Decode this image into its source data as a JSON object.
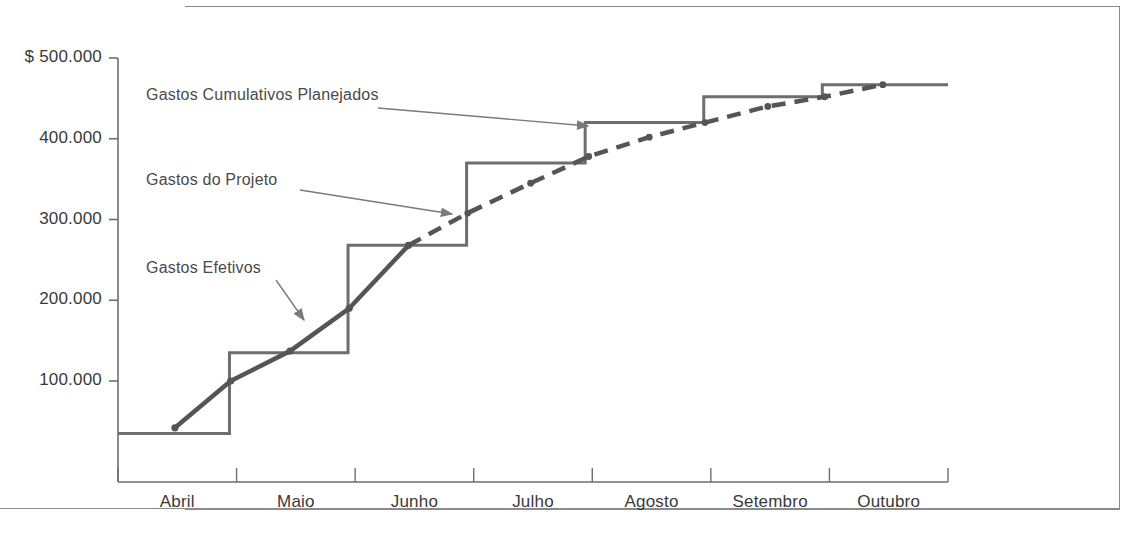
{
  "chart_data": {
    "type": "line",
    "title": "",
    "xlabel": "",
    "ylabel": "",
    "currency_prefix": "$",
    "x_categories": [
      "Abril",
      "Maio",
      "Junho",
      "Julho",
      "Agosto",
      "Setembro",
      "Outubro"
    ],
    "y_ticks": [
      {
        "value": 500000,
        "label": "$ 500.000"
      },
      {
        "value": 400000,
        "label": "400.000"
      },
      {
        "value": 300000,
        "label": "300.000"
      },
      {
        "value": 200000,
        "label": "200.000"
      },
      {
        "value": 100000,
        "label": "100.000"
      }
    ],
    "ylim": [
      0,
      515000
    ],
    "grid": false,
    "legend_position": "inline-annotations",
    "series": [
      {
        "name": "Gastos Cumulativos Planejados",
        "style": "step",
        "color": "#6e6e6e",
        "steps": [
          {
            "x_start": 0.0,
            "x_end": 0.94,
            "value": 35000
          },
          {
            "x_start": 0.94,
            "x_end": 1.94,
            "value": 135000
          },
          {
            "x_start": 1.94,
            "x_end": 2.94,
            "value": 268000
          },
          {
            "x_start": 2.94,
            "x_end": 3.94,
            "value": 370000
          },
          {
            "x_start": 3.94,
            "x_end": 4.94,
            "value": 420000
          },
          {
            "x_start": 4.94,
            "x_end": 5.94,
            "value": 452000
          },
          {
            "x_start": 5.94,
            "x_end": 7.0,
            "value": 467000
          }
        ]
      },
      {
        "name": "Gastos Efetivos",
        "style": "solid-curve",
        "color": "#555555",
        "points": [
          {
            "x": 0.48,
            "y": 42000
          },
          {
            "x": 0.95,
            "y": 100000
          },
          {
            "x": 1.45,
            "y": 137000
          },
          {
            "x": 1.95,
            "y": 190000
          },
          {
            "x": 2.45,
            "y": 268000
          }
        ]
      },
      {
        "name": "Gastos do Projeto",
        "style": "dashed",
        "color": "#555555",
        "points": [
          {
            "x": 2.45,
            "y": 268000
          },
          {
            "x": 2.95,
            "y": 308000
          },
          {
            "x": 3.48,
            "y": 345000
          },
          {
            "x": 3.97,
            "y": 378000
          },
          {
            "x": 4.48,
            "y": 402000
          },
          {
            "x": 4.95,
            "y": 420000
          },
          {
            "x": 5.48,
            "y": 440000
          },
          {
            "x": 5.96,
            "y": 452000
          },
          {
            "x": 6.45,
            "y": 467000
          }
        ]
      }
    ],
    "annotations": [
      {
        "id": "planned",
        "text": "Gastos Cumulativos Planejados",
        "label_x": 146,
        "label_y": 86,
        "arrow_from_x": 378,
        "arrow_from_y": 108,
        "arrow_to_x": 588,
        "arrow_to_y": 126
      },
      {
        "id": "project",
        "text": "Gastos do Projeto",
        "label_x": 146,
        "label_y": 171,
        "arrow_from_x": 300,
        "arrow_from_y": 190,
        "arrow_to_x": 452,
        "arrow_to_y": 214
      },
      {
        "id": "actual",
        "text": "Gastos Efetivos",
        "label_x": 146,
        "label_y": 259,
        "arrow_from_x": 276,
        "arrow_from_y": 280,
        "arrow_to_x": 304,
        "arrow_to_y": 320
      }
    ]
  }
}
